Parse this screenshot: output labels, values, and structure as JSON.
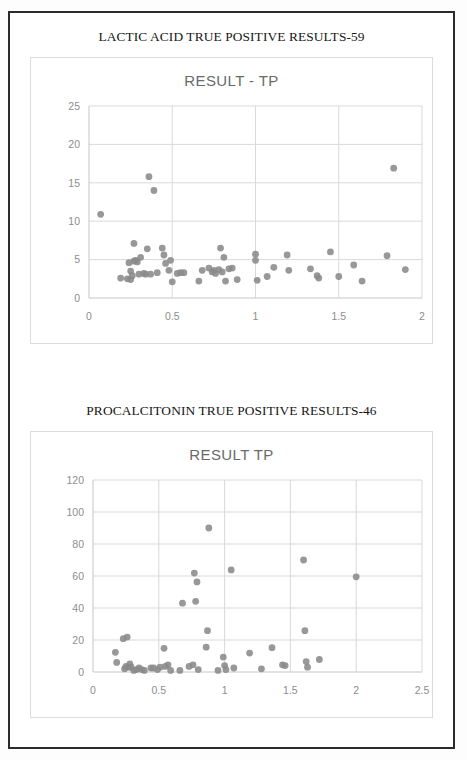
{
  "document": {
    "background_color": "#ffffff",
    "frame_color": "#2b2b2b"
  },
  "figures": [
    {
      "caption": "LACTIC ACID TRUE POSITIVE RESULTS-59",
      "caption_name": "lactic-acid-caption"
    },
    {
      "caption": "PROCALCITONIN TRUE POSITIVE RESULTS-46",
      "caption_name": "procalcitonin-caption"
    }
  ],
  "chart_data": [
    {
      "type": "scatter",
      "title": "RESULT - TP",
      "xlabel": "",
      "ylabel": "",
      "xlim": [
        0,
        2
      ],
      "ylim": [
        0,
        25
      ],
      "xticks": [
        0,
        0.5,
        1,
        1.5,
        2
      ],
      "xticklabels": [
        "0",
        "0.5",
        "1",
        "1.5",
        "2"
      ],
      "yticks": [
        0,
        5,
        10,
        15,
        20,
        25
      ],
      "yticklabels": [
        "0",
        "5",
        "10",
        "15",
        "20",
        "25"
      ],
      "grid": "horizontal-and-vertical",
      "legend": "none",
      "marker_color": "#8a8a8a",
      "n_points": 59,
      "points": [
        [
          0.07,
          10.9
        ],
        [
          0.19,
          2.6
        ],
        [
          0.23,
          2.5
        ],
        [
          0.24,
          4.6
        ],
        [
          0.25,
          2.4
        ],
        [
          0.25,
          3.5
        ],
        [
          0.26,
          2.9
        ],
        [
          0.27,
          4.8
        ],
        [
          0.27,
          7.1
        ],
        [
          0.28,
          4.9
        ],
        [
          0.29,
          4.7
        ],
        [
          0.3,
          3.1
        ],
        [
          0.31,
          5.3
        ],
        [
          0.33,
          3.2
        ],
        [
          0.34,
          3.1
        ],
        [
          0.35,
          6.4
        ],
        [
          0.36,
          15.8
        ],
        [
          0.37,
          3.1
        ],
        [
          0.39,
          14.0
        ],
        [
          0.41,
          3.3
        ],
        [
          0.44,
          6.5
        ],
        [
          0.45,
          5.6
        ],
        [
          0.46,
          4.5
        ],
        [
          0.48,
          3.6
        ],
        [
          0.49,
          4.9
        ],
        [
          0.5,
          2.1
        ],
        [
          0.53,
          3.2
        ],
        [
          0.55,
          3.3
        ],
        [
          0.57,
          3.3
        ],
        [
          0.66,
          2.2
        ],
        [
          0.68,
          3.6
        ],
        [
          0.72,
          3.9
        ],
        [
          0.74,
          3.4
        ],
        [
          0.75,
          3.6
        ],
        [
          0.76,
          3.2
        ],
        [
          0.78,
          3.7
        ],
        [
          0.79,
          6.5
        ],
        [
          0.8,
          3.4
        ],
        [
          0.81,
          5.3
        ],
        [
          0.82,
          2.2
        ],
        [
          0.84,
          3.8
        ],
        [
          0.86,
          3.9
        ],
        [
          0.89,
          2.4
        ],
        [
          1.0,
          5.7
        ],
        [
          1.0,
          4.9
        ],
        [
          1.01,
          2.3
        ],
        [
          1.07,
          2.8
        ],
        [
          1.11,
          4.0
        ],
        [
          1.19,
          5.6
        ],
        [
          1.2,
          3.6
        ],
        [
          1.33,
          3.8
        ],
        [
          1.37,
          2.9
        ],
        [
          1.38,
          2.6
        ],
        [
          1.45,
          6.0
        ],
        [
          1.5,
          2.8
        ],
        [
          1.59,
          4.3
        ],
        [
          1.64,
          2.2
        ],
        [
          1.79,
          5.5
        ],
        [
          1.83,
          16.9
        ],
        [
          1.9,
          3.7
        ]
      ]
    },
    {
      "type": "scatter",
      "title": "RESULT TP",
      "xlabel": "",
      "ylabel": "",
      "xlim": [
        0,
        2.5
      ],
      "ylim": [
        0,
        120
      ],
      "xticks": [
        0,
        0.5,
        1,
        1.5,
        2,
        2.5
      ],
      "xticklabels": [
        "0",
        "0.5",
        "1",
        "1.5",
        "2",
        "2.5"
      ],
      "yticks": [
        0,
        20,
        40,
        60,
        80,
        100,
        120
      ],
      "yticklabels": [
        "0",
        "20",
        "40",
        "60",
        "80",
        "100",
        "120"
      ],
      "grid": "horizontal-and-vertical",
      "legend": "none",
      "marker_color": "#8a8a8a",
      "n_points": 46,
      "points": [
        [
          0.17,
          12.3
        ],
        [
          0.18,
          6.0
        ],
        [
          0.23,
          20.8
        ],
        [
          0.24,
          2.0
        ],
        [
          0.25,
          3.5
        ],
        [
          0.26,
          21.8
        ],
        [
          0.27,
          3.0
        ],
        [
          0.28,
          5.0
        ],
        [
          0.29,
          3.0
        ],
        [
          0.31,
          1.0
        ],
        [
          0.33,
          1.5
        ],
        [
          0.35,
          2.5
        ],
        [
          0.37,
          1.5
        ],
        [
          0.39,
          1.0
        ],
        [
          0.44,
          2.5
        ],
        [
          0.46,
          2.5
        ],
        [
          0.49,
          1.5
        ],
        [
          0.51,
          3.0
        ],
        [
          0.54,
          14.8
        ],
        [
          0.55,
          3.5
        ],
        [
          0.57,
          4.5
        ],
        [
          0.59,
          1.0
        ],
        [
          0.66,
          1.0
        ],
        [
          0.68,
          43.0
        ],
        [
          0.73,
          3.5
        ],
        [
          0.76,
          4.5
        ],
        [
          0.77,
          61.8
        ],
        [
          0.78,
          44.2
        ],
        [
          0.79,
          56.3
        ],
        [
          0.8,
          1.5
        ],
        [
          0.86,
          15.5
        ],
        [
          0.87,
          25.8
        ],
        [
          0.88,
          90.0
        ],
        [
          0.95,
          1.0
        ],
        [
          0.99,
          9.3
        ],
        [
          1.0,
          4.0
        ],
        [
          1.01,
          1.5
        ],
        [
          1.05,
          63.8
        ],
        [
          1.07,
          2.5
        ],
        [
          1.19,
          11.8
        ],
        [
          1.28,
          2.0
        ],
        [
          1.36,
          15.2
        ],
        [
          1.44,
          4.5
        ],
        [
          1.46,
          4.0
        ],
        [
          1.6,
          70.0
        ],
        [
          1.61,
          25.8
        ],
        [
          1.62,
          6.5
        ],
        [
          1.63,
          3.0
        ],
        [
          1.72,
          7.8
        ],
        [
          2.0,
          59.5
        ]
      ]
    }
  ]
}
